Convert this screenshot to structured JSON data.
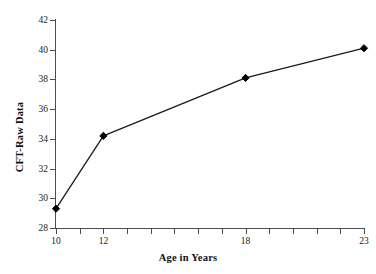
{
  "chart_data": {
    "type": "line",
    "title": "",
    "subtitle": "",
    "xlabel": "Age in Years",
    "ylabel": "CFT-Raw Data",
    "x": [
      10,
      12,
      18,
      23
    ],
    "values": [
      29.3,
      34.2,
      38.1,
      40.1
    ],
    "series": [
      {
        "name": "CFT-Raw Data",
        "x": [
          10,
          12,
          18,
          23
        ],
        "values": [
          29.3,
          34.2,
          38.1,
          40.1
        ]
      }
    ],
    "xlim": [
      10,
      23
    ],
    "ylim": [
      28,
      42
    ],
    "ytick_values": [
      28,
      30,
      32,
      34,
      36,
      38,
      40,
      42
    ],
    "ytick_labels": [
      "28",
      "30",
      "32",
      "34",
      "36",
      "38",
      "40",
      "42"
    ],
    "xtick_values": [
      10,
      11,
      12,
      13,
      14,
      15,
      16,
      17,
      18,
      19,
      20,
      21,
      22,
      23
    ],
    "xtick_labeled": [
      10,
      12,
      18,
      23
    ],
    "xtick_labels": [
      "10",
      "12",
      "18",
      "23"
    ],
    "grid": false,
    "legend": false,
    "legend_position": "none",
    "marker": "diamond",
    "marker_color": "#000000",
    "line_color": "#1a1a1a",
    "background_color": "#ffffff",
    "axis_color": "#4d4d4d"
  }
}
